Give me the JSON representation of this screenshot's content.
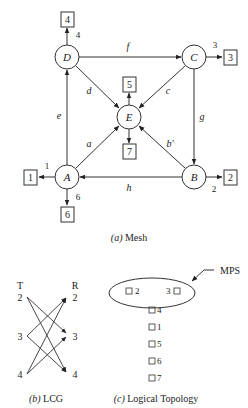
{
  "mesh": {
    "caption_letter": "(a)",
    "caption_text": " Mesh",
    "nodes": {
      "A": {
        "label": "A",
        "x": 67,
        "y": 177
      },
      "B": {
        "label": "B",
        "x": 194,
        "y": 177
      },
      "C": {
        "label": "C",
        "x": 194,
        "y": 57
      },
      "D": {
        "label": "D",
        "x": 67,
        "y": 57
      },
      "E": {
        "label": "E",
        "x": 129,
        "y": 117
      }
    },
    "edges": {
      "a": "a",
      "b": "b′",
      "c": "c",
      "d": "d",
      "e": "e",
      "f": "f",
      "g": "g",
      "h": "h"
    },
    "ports": {
      "p1": {
        "box": "1",
        "label": "1"
      },
      "p2": {
        "box": "2",
        "label": "2"
      },
      "p3": {
        "box": "3",
        "label": "3"
      },
      "p4": {
        "box": "4",
        "label": "4"
      },
      "p5": {
        "box": "5"
      },
      "p6": {
        "box": "6",
        "label": "6"
      },
      "p7": {
        "box": "7"
      }
    }
  },
  "lcg": {
    "caption_letter": "(b)",
    "caption_text": " LCG",
    "transmit_header": "T",
    "receive_header": "R",
    "transmitters": [
      "2",
      "3",
      "4"
    ],
    "receivers": [
      "2",
      "3",
      "4"
    ],
    "connections": [
      {
        "from": "2",
        "to": "3"
      },
      {
        "from": "2",
        "to": "4"
      },
      {
        "from": "3",
        "to": "2"
      },
      {
        "from": "3",
        "to": "4"
      },
      {
        "from": "4",
        "to": "2"
      },
      {
        "from": "4",
        "to": "3"
      }
    ]
  },
  "logical_topology": {
    "caption_letter": "(c)",
    "caption_text": " Logical Topology",
    "mps_label": "MPS",
    "mps_members": [
      "2",
      "3"
    ],
    "other_nodes": [
      "4",
      "1",
      "5",
      "6",
      "7"
    ]
  }
}
